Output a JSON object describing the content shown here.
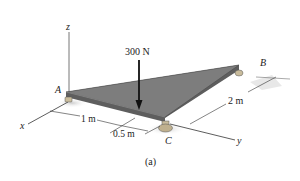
{
  "diagram": {
    "caption": "(a)",
    "force": {
      "label": "300 N"
    },
    "points": {
      "A": "A",
      "B": "B",
      "C": "C"
    },
    "axes": {
      "x": "x",
      "y": "y",
      "z": "z"
    },
    "dimensions": {
      "d1": "1 m",
      "d2": "0.5 m",
      "d3": "2 m"
    },
    "colors": {
      "plate_top": "#7a7a7a",
      "plate_edge": "#5a5a5a",
      "support": "#b8a98a",
      "line": "#333333"
    }
  }
}
